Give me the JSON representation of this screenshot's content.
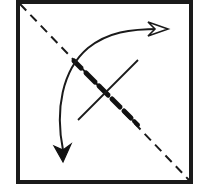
{
  "diagram": {
    "type": "origami-fold-step",
    "colors": {
      "background": "#ffffff",
      "stroke": "#1a1a1a"
    },
    "elements": {
      "paper_square": {
        "label": "paper square"
      },
      "valley_fold_line": {
        "label": "diagonal dashed fold line"
      },
      "crease_segment": {
        "label": "bold crease segment"
      },
      "pinch_mark": {
        "label": "perpendicular crossing line"
      },
      "fold_arrow": {
        "label": "curved fold arrow (fold over)"
      },
      "unfold_arrow_head": {
        "label": "hollow arrowhead (unfold)"
      },
      "fold_arrow_head": {
        "label": "solid arrowhead (fold)"
      }
    }
  }
}
